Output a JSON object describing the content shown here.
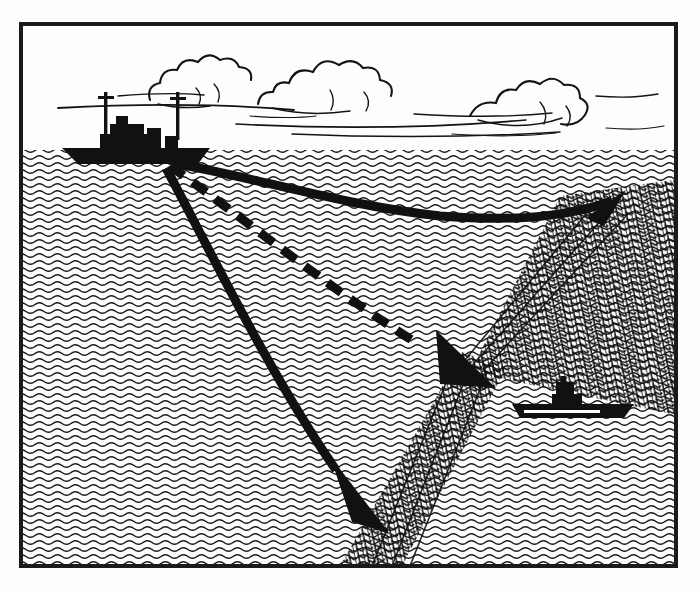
{
  "illustration": {
    "title": "Sonar propagation through a thermal layer",
    "medium": "black-and-white line engraving",
    "frame": {
      "x": 19,
      "y": 22,
      "width": 659,
      "height": 546,
      "border_width": 4,
      "border_color": "#1a1a1a",
      "paper_color": "#fdfdfb"
    },
    "ink_color": "#141414",
    "sky": {
      "label": "sky",
      "y_top": 26,
      "y_bottom": 150,
      "fill": "#fdfdfb",
      "clouds": [
        {
          "name": "cloud-left",
          "cx": 205,
          "cy": 78,
          "w": 150,
          "h": 52
        },
        {
          "name": "cloud-center",
          "cx": 345,
          "cy": 70,
          "w": 180,
          "h": 60
        },
        {
          "name": "cloud-right",
          "cx": 545,
          "cy": 82,
          "w": 150,
          "h": 56
        }
      ],
      "wind_streaks": 9
    },
    "sea": {
      "label": "sea",
      "surface_y": 150,
      "bottom_y": 564,
      "wave_wavelength": 18,
      "wave_amplitude": 2.6,
      "wave_row_pitch": 7.0,
      "wave_stroke": 1.5,
      "wave_color": "#1a1a1a"
    },
    "surface_ship": {
      "name": "surface-ship",
      "label": "sonar-emitting surface vessel",
      "hull_x": 62,
      "hull_y": 148,
      "hull_length": 148,
      "hull_height": 16,
      "masts": 2,
      "funnel": 1,
      "superstructure": "bridge"
    },
    "submarine": {
      "name": "submarine",
      "label": "submerged submarine hiding below the layer",
      "hull_cx": 572,
      "hull_cy": 412,
      "hull_length": 124,
      "hull_height": 13,
      "conning_tower": true,
      "waterline_stripe": "#fdfdfb"
    },
    "thermal_layer": {
      "name": "thermal-layer",
      "label": "thermal layer / thermocline (dense cross-hatching)",
      "vertex_x": 472,
      "vertex_y": 362,
      "upper_arm_end_x": 660,
      "upper_arm_end_y": 205,
      "lower_arm_end_x": 372,
      "lower_arm_end_y": 566,
      "hatch_count": 26
    },
    "sound_beams": [
      {
        "name": "beam-reflected-upper",
        "label": "upper beam bending upward along the layer",
        "style": "solid",
        "stroke_width": 9,
        "arrowhead": "filled-triangle",
        "path": "M 172 163 C 250 176 340 205 440 216 C 520 222 570 216 612 201",
        "tip": {
          "x": 620,
          "y": 198
        }
      },
      {
        "name": "beam-trapped-dashed",
        "label": "middle beam refracted into the layer shown dashed",
        "style": "dashed",
        "dash_pattern": "17 11",
        "stroke_width": 9,
        "arrowhead": "filled-triangle",
        "path": "M 170 166 C 240 215 330 290 420 345",
        "tip": {
          "x": 492,
          "y": 384
        }
      },
      {
        "name": "beam-downward",
        "label": "lower beam continuing into the deep",
        "style": "solid",
        "stroke_width": 9,
        "arrowhead": "filled-triangle",
        "path": "M 166 168 C 210 250 270 375 336 470",
        "tip": {
          "x": 386,
          "y": 528
        }
      }
    ]
  }
}
